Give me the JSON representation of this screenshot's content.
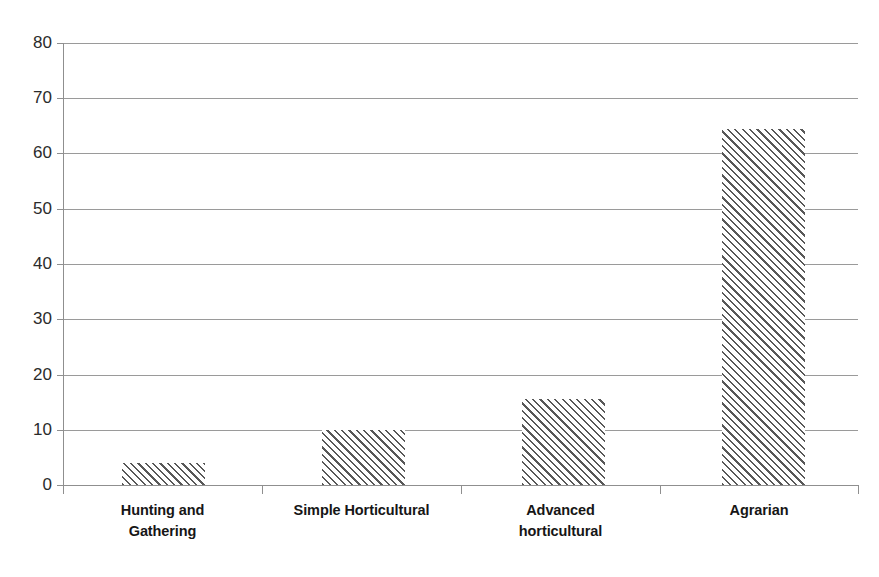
{
  "chart_data": {
    "type": "bar",
    "title": "",
    "subtitle": "",
    "xlabel": "",
    "ylabel": "",
    "categories": [
      "Hunting and Gathering",
      "Simple Horticultural",
      "Advanced horticultural",
      "Agrarian"
    ],
    "values": [
      4,
      10,
      15.5,
      64.5
    ],
    "series": [
      {
        "name": "",
        "values": [
          4,
          10,
          15.5,
          64.5
        ]
      }
    ],
    "ylim": [
      0,
      80
    ],
    "ytick_labels": [
      "80",
      "70",
      "60",
      "50",
      "40",
      "30",
      "20",
      "10",
      "0"
    ],
    "ytick_values": [
      80,
      70,
      60,
      50,
      40,
      30,
      20,
      10,
      0
    ],
    "grid": true,
    "legend": false,
    "legend_position": "none",
    "bar_fill": "diagonal-hatch",
    "bar_hatch_color": "#585858",
    "bar_background_color": "#ffffff",
    "axis_color": "#8f8f8f",
    "gridline_color": "#9a9a9a",
    "label_color": "#161616",
    "tick_label_color": "#2b2b2b",
    "background_color": "#ffffff"
  },
  "category_label_lines": [
    [
      "Hunting and",
      "Gathering"
    ],
    [
      "Simple Horticultural"
    ],
    [
      "Advanced",
      "horticultural"
    ],
    [
      "Agrarian"
    ]
  ]
}
